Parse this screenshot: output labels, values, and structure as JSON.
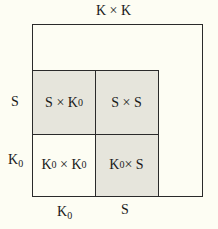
{
  "diagram": {
    "title": "K × K",
    "row_labels": [
      {
        "base": "S",
        "sub": ""
      },
      {
        "base": "K",
        "sub": "0"
      }
    ],
    "col_labels": [
      {
        "base": "K",
        "sub": "0"
      },
      {
        "base": "S",
        "sub": ""
      }
    ],
    "cells": [
      {
        "a": "S",
        "a_sub": "",
        "op": " × ",
        "b": "K",
        "b_sub": "0",
        "shaded": true
      },
      {
        "a": "S",
        "a_sub": "",
        "op": " × ",
        "b": "S",
        "b_sub": "",
        "shaded": true
      },
      {
        "a": "K",
        "a_sub": "0",
        "op": " × ",
        "b": "K",
        "b_sub": "0",
        "shaded": false
      },
      {
        "a": "K",
        "a_sub": "0",
        "op": "× ",
        "b": "S",
        "b_sub": "",
        "shaded": true
      }
    ],
    "colors": {
      "background": "#fdfdf3",
      "shaded": "#e6e5dc",
      "line": "#2a2a2a"
    }
  }
}
